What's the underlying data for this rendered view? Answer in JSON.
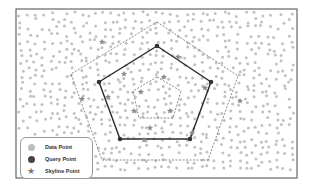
{
  "colors": {
    "frame": "#666666",
    "data_point": "#c2c2c2",
    "query_point": "#333333",
    "skyline_point": "#8a8a8a",
    "solid_polygon": "#2a2a2a",
    "dashed_polygon": "#7a7a7a",
    "background": "#ffffff"
  },
  "frame": {
    "x": 16,
    "y": 9,
    "w": 281,
    "h": 169
  },
  "polygons": {
    "outer_dashed": [
      [
        157,
        22
      ],
      [
        238,
        76
      ],
      [
        208,
        160
      ],
      [
        102,
        160
      ],
      [
        71,
        74
      ]
    ],
    "query_solid": [
      [
        157,
        46
      ],
      [
        211,
        82
      ],
      [
        190,
        139
      ],
      [
        120,
        139
      ],
      [
        99,
        82
      ]
    ],
    "inner_dashed": [
      [
        157,
        77
      ],
      [
        181,
        91
      ],
      [
        173,
        118
      ],
      [
        139,
        118
      ],
      [
        133,
        91
      ]
    ]
  },
  "query_points": [
    [
      157,
      46
    ],
    [
      211,
      82
    ],
    [
      190,
      139
    ],
    [
      120,
      139
    ],
    [
      99,
      82
    ]
  ],
  "skyline_points": [
    [
      102,
      42
    ],
    [
      124,
      74
    ],
    [
      178,
      57
    ],
    [
      164,
      77
    ],
    [
      141,
      92
    ],
    [
      108,
      97
    ],
    [
      134,
      111
    ],
    [
      170,
      111
    ],
    [
      150,
      128
    ],
    [
      144,
      140
    ],
    [
      192,
      133
    ],
    [
      82,
      99
    ],
    [
      240,
      101
    ],
    [
      205,
      88
    ]
  ],
  "legend": {
    "items": [
      {
        "label": "Data Point",
        "symbol": "circle-light"
      },
      {
        "label": "Query Point",
        "symbol": "circle-dark"
      },
      {
        "label": "Skyline Point",
        "symbol": "star"
      }
    ]
  }
}
